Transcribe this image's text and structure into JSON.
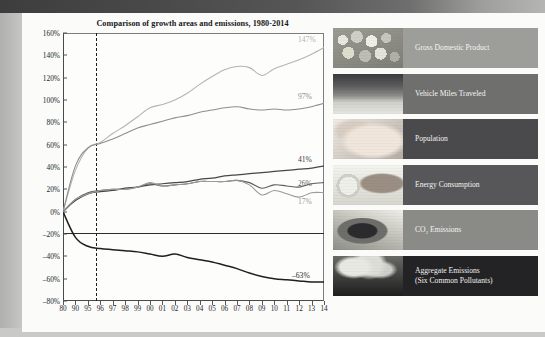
{
  "chart_data": {
    "type": "line",
    "title": "Comparison of growth areas and emissions, 1980-2014",
    "xlabel": "",
    "ylabel": "",
    "ylim": [
      -80,
      160
    ],
    "ytick_values": [
      160,
      140,
      120,
      100,
      80,
      60,
      40,
      20,
      0,
      -20,
      -40,
      -60,
      -80
    ],
    "ytick_labels": [
      "160%",
      "140%",
      "120%",
      "100%",
      "80%",
      "60%",
      "40%",
      "20%",
      "0%",
      "–20%",
      "–40%",
      "–60%",
      "–80%"
    ],
    "xtick_labels": [
      "80",
      "90",
      "95",
      "96",
      "97",
      "98",
      "99",
      "00",
      "01",
      "02",
      "03",
      "04",
      "05",
      "06",
      "07",
      "08",
      "09",
      "10",
      "11",
      "12",
      "13",
      "14"
    ],
    "x": [
      1980,
      1990,
      1995,
      1996,
      1997,
      1998,
      1999,
      2000,
      2001,
      2002,
      2003,
      2004,
      2005,
      2006,
      2007,
      2008,
      2009,
      2010,
      2011,
      2012,
      2013,
      2014
    ],
    "grid": false,
    "legend_position": "right",
    "reference_line": {
      "label": "1995",
      "x": 1995,
      "style": "dashed"
    },
    "series": [
      {
        "name": "Gross Domestic Product",
        "end_label": "147%",
        "color": "#b4b4b0",
        "values": [
          0,
          37,
          57,
          62,
          70,
          77,
          85,
          93,
          96,
          100,
          106,
          114,
          121,
          127,
          130,
          129,
          122,
          128,
          132,
          136,
          141,
          147
        ]
      },
      {
        "name": "Vehicle Miles Traveled",
        "end_label": "97%",
        "color": "#8e8e8a",
        "values": [
          0,
          41,
          57,
          61,
          65,
          70,
          75,
          78,
          81,
          84,
          86,
          89,
          91,
          93,
          94,
          92,
          91,
          92,
          91,
          92,
          94,
          97
        ]
      },
      {
        "name": "Population",
        "end_label": "41%",
        "color": "#47474b",
        "values": [
          0,
          10,
          16,
          18,
          19,
          21,
          22,
          24,
          25,
          26,
          27,
          29,
          30,
          32,
          33,
          34,
          35,
          36,
          37,
          38,
          39,
          41
        ]
      },
      {
        "name": "Energy Consumption",
        "end_label": "26%",
        "color": "#5e5e62",
        "values": [
          0,
          11,
          17,
          19,
          20,
          20,
          22,
          25,
          23,
          24,
          25,
          27,
          27,
          27,
          28,
          26,
          21,
          24,
          23,
          22,
          25,
          26
        ]
      },
      {
        "name": "CO₂ Emissions",
        "end_label": "17%",
        "color": "#9a9a97",
        "values": [
          0,
          11,
          16,
          19,
          20,
          20,
          22,
          26,
          23,
          24,
          25,
          27,
          27,
          27,
          28,
          24,
          15,
          19,
          16,
          13,
          17,
          17
        ]
      },
      {
        "name": "Aggregate Emissions (Six Common Pollutants)",
        "end_label": "–63%",
        "color": "#1f1f22",
        "values": [
          0,
          -23,
          -31,
          -33,
          -34,
          -35,
          -36,
          -38,
          -40,
          -38,
          -41,
          -43,
          -45,
          -48,
          -51,
          -55,
          -58,
          -60,
          -61,
          -62,
          -63,
          -63
        ]
      }
    ]
  },
  "legend": {
    "items": [
      {
        "label": "Gross Domestic Product",
        "thumb": "coins-photo",
        "band_color": "#9d9d9a",
        "text_color": "#f5f5f2"
      },
      {
        "label": "Vehicle Miles Traveled",
        "thumb": "traffic-photo",
        "band_color": "#6f6f6d",
        "text_color": "#f5f5f2"
      },
      {
        "label": "Population",
        "thumb": "baby-photo",
        "band_color": "#4a4a4c",
        "text_color": "#f2f2ef"
      },
      {
        "label": "Energy Consumption",
        "thumb": "electrical-plug-photo",
        "band_color": "#575759",
        "text_color": "#f3f3f0"
      },
      {
        "label": "CO₂ Emissions",
        "thumb": "exhaust-pipe-photo",
        "band_color": "#8a8a87",
        "text_color": "#f5f5f2"
      },
      {
        "label": "Aggregate Emissions<br>(Six Common Pollutants)",
        "thumb": "smokestacks-photo",
        "band_color": "#232325",
        "text_color": "#f1f1ee"
      }
    ]
  }
}
